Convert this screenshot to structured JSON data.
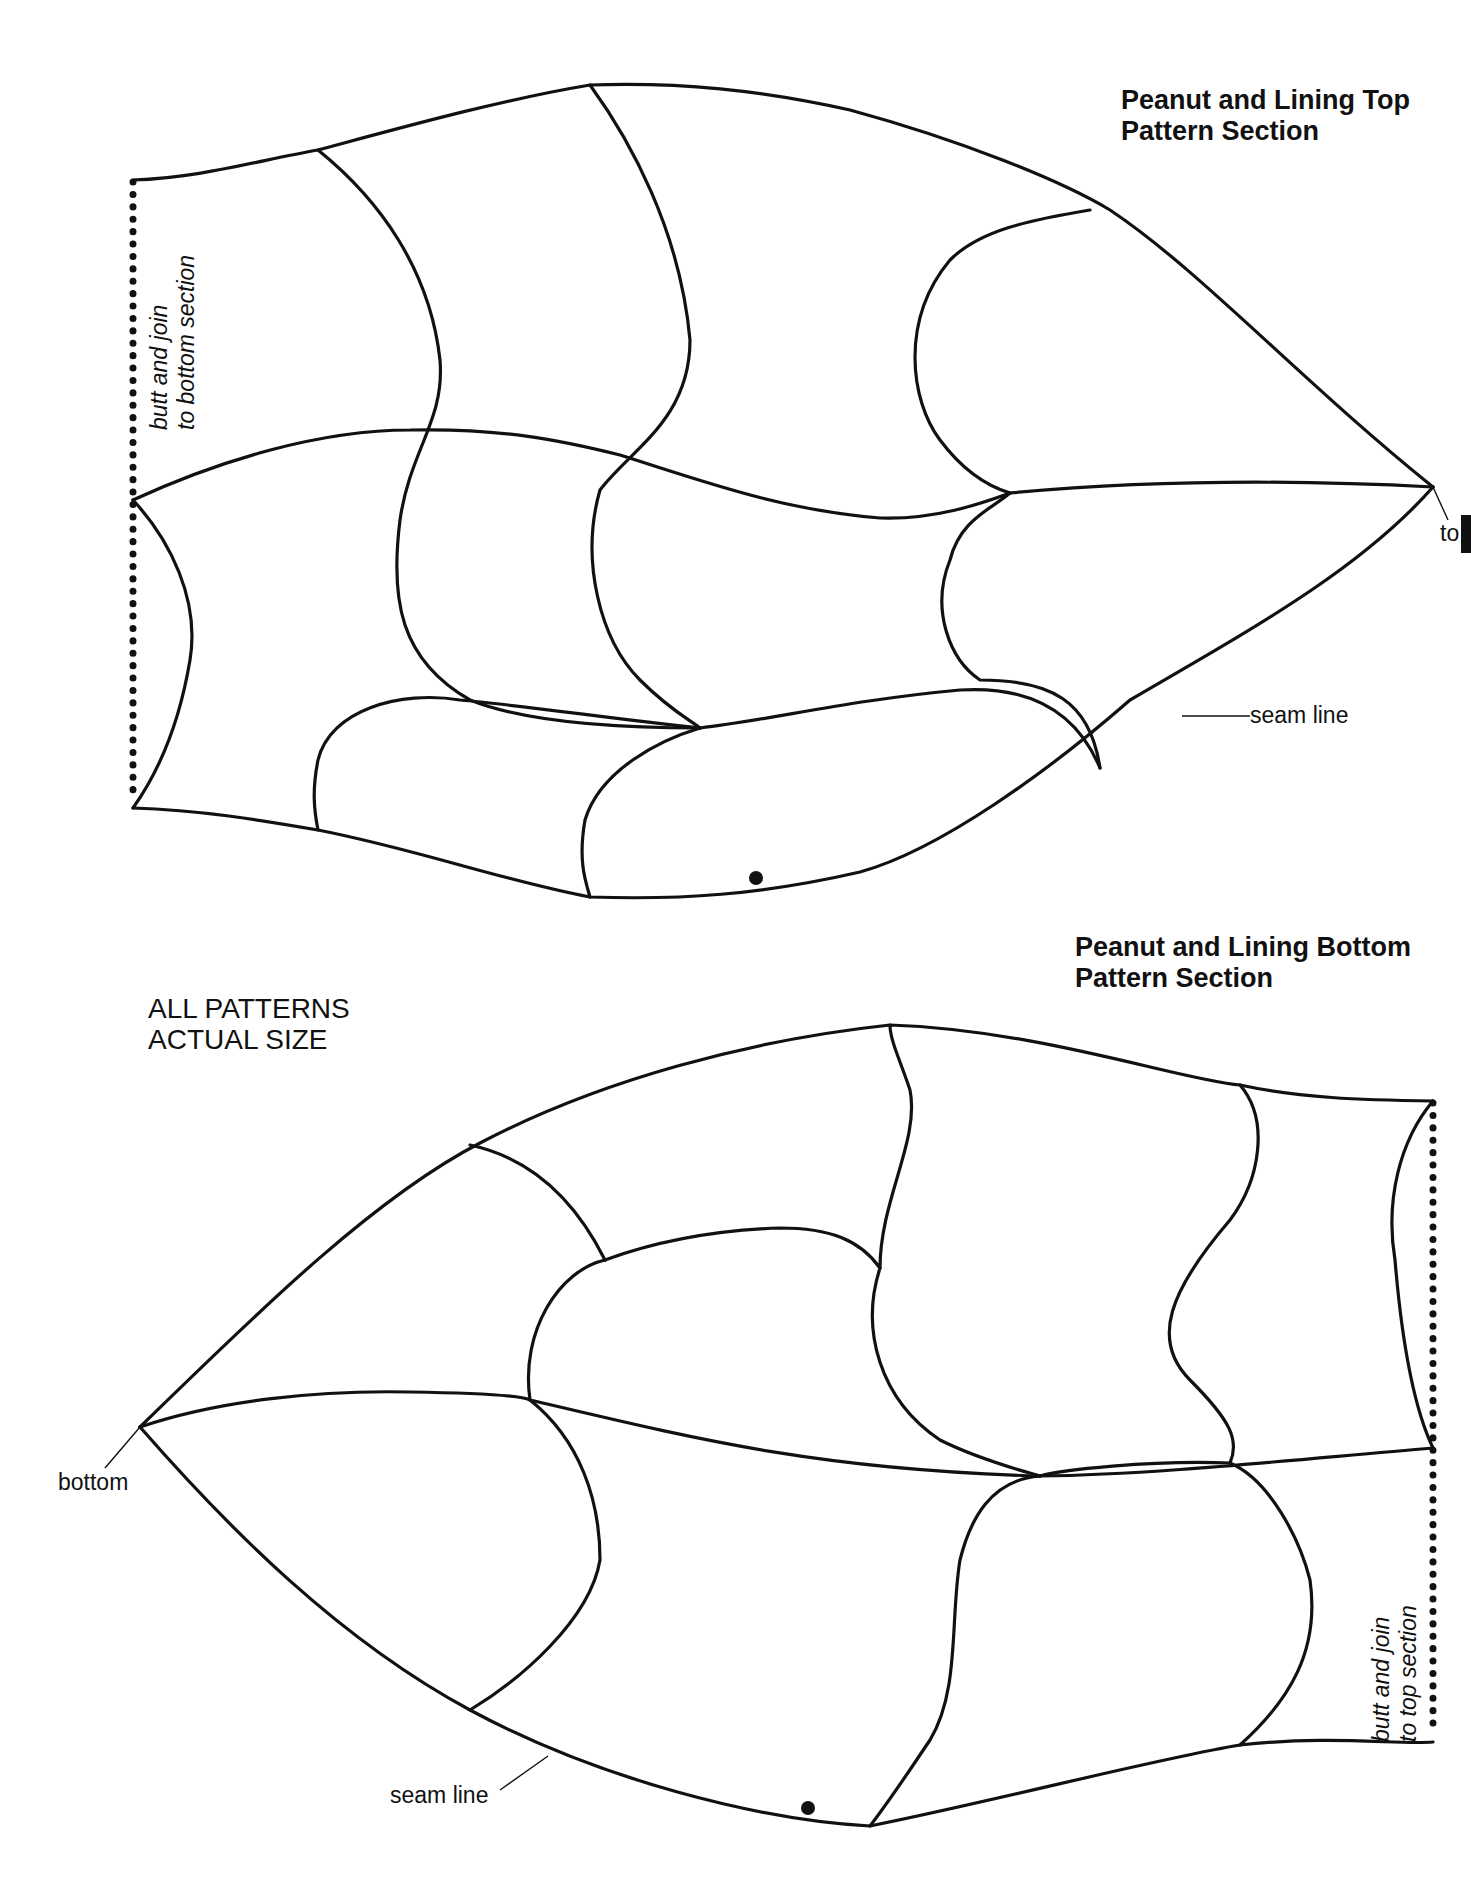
{
  "document": {
    "type": "sewing pattern page",
    "note_lines": [
      "ALL PATTERNS",
      "ACTUAL SIZE"
    ]
  },
  "top_section": {
    "title_lines": [
      "Peanut and Lining Top",
      "Pattern Section"
    ],
    "join_note_lines": [
      "butt and join",
      "to bottom section"
    ],
    "tip_label": "to",
    "seam_label": "seam line"
  },
  "bottom_section": {
    "title_lines": [
      "Peanut and Lining Bottom",
      "Pattern Section"
    ],
    "join_note_lines": [
      "butt and join",
      "to top section"
    ],
    "tip_label": "bottom",
    "seam_label": "seam line"
  },
  "colors": {
    "ink": "#111111",
    "paper": "#ffffff"
  }
}
